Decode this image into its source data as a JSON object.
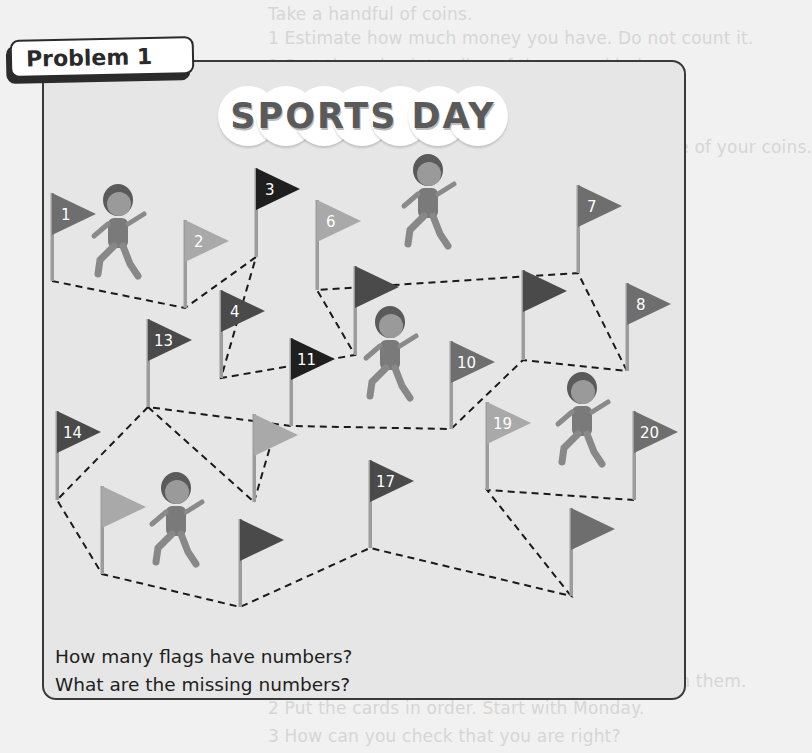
{
  "background_text": [
    {
      "text": "Take a handful of coins.",
      "x": 268,
      "y": 18
    },
    {
      "text": "1 Estimate how much money you have. Do not count it.",
      "x": 268,
      "y": 42
    },
    {
      "text": "2 Sort the coins into piles of the same kind.",
      "x": 268,
      "y": 70
    },
    {
      "text": "a  What kind of coin do you have the most of?",
      "x": 285,
      "y": 97
    },
    {
      "text": "b  Which kind do you have the fewest of?",
      "x": 285,
      "y": 124
    },
    {
      "text": "3 Use a number line to help you count the value of your coins.",
      "x": 268,
      "y": 151
    },
    {
      "text": "Was your estimate close?",
      "x": 285,
      "y": 177
    },
    {
      "text": "B Measure",
      "x": 268,
      "y": 233
    },
    {
      "text": "1 Look at the objects on the table.",
      "x": 268,
      "y": 260
    },
    {
      "text": "a  How many cubes long is each object?",
      "x": 285,
      "y": 288
    },
    {
      "text": "b  Estimate the length of each.",
      "x": 285,
      "y": 315
    },
    {
      "text": "2 Which is the longest? Which is the shortest?",
      "x": 268,
      "y": 380
    },
    {
      "text": "3 Put the objects in order of length.",
      "x": 268,
      "y": 408
    },
    {
      "text": "Write which one is the longest.",
      "x": 285,
      "y": 462
    },
    {
      "text": "4 Which container holds the most?",
      "x": 268,
      "y": 516
    },
    {
      "text": "Fill each container with water.",
      "x": 285,
      "y": 544
    },
    {
      "text": "Which holds the least?",
      "x": 285,
      "y": 572
    },
    {
      "text": "C Time",
      "x": 268,
      "y": 657
    },
    {
      "text": "1 Shuffle the cards with the days of the week on them.",
      "x": 268,
      "y": 685
    },
    {
      "text": "2 Put the cards in order. Start with Monday.",
      "x": 268,
      "y": 712
    },
    {
      "text": "3 How can you check that you are right?",
      "x": 268,
      "y": 740
    }
  ],
  "problem": {
    "label": "Problem 1",
    "banner_title": "SPORTS DAY",
    "questions": [
      "How many flags have numbers?",
      "What are the missing numbers?"
    ]
  },
  "colors": {
    "panel_bg": "#e6e6e6",
    "panel_border": "#3a3a3a",
    "flag_black": "#1f1f1f",
    "flag_dark": "#4a4a4a",
    "flag_medium": "#6e6e6e",
    "flag_light": "#a9a9a9"
  },
  "flags": [
    {
      "id": "flag-1",
      "label": "1",
      "x": 52,
      "top": 193,
      "bottom": 281,
      "shade": "medium"
    },
    {
      "id": "flag-2",
      "label": "2",
      "x": 185,
      "top": 220,
      "bottom": 308,
      "shade": "light"
    },
    {
      "id": "flag-3",
      "label": "3",
      "x": 256,
      "top": 168,
      "bottom": 257,
      "shade": "black"
    },
    {
      "id": "flag-4",
      "label": "4",
      "x": 221,
      "top": 290,
      "bottom": 378,
      "shade": "dark"
    },
    {
      "id": "flag-blank-a",
      "label": "",
      "x": 355,
      "top": 266,
      "bottom": 355,
      "shade": "dark"
    },
    {
      "id": "flag-6",
      "label": "6",
      "x": 317,
      "top": 200,
      "bottom": 290,
      "shade": "light"
    },
    {
      "id": "flag-7",
      "label": "7",
      "x": 578,
      "top": 185,
      "bottom": 273,
      "shade": "medium"
    },
    {
      "id": "flag-8",
      "label": "8",
      "x": 627,
      "top": 283,
      "bottom": 371,
      "shade": "medium"
    },
    {
      "id": "flag-blank-b",
      "label": "",
      "x": 523,
      "top": 270,
      "bottom": 360,
      "shade": "dark"
    },
    {
      "id": "flag-10",
      "label": "10",
      "x": 451,
      "top": 341,
      "bottom": 429,
      "shade": "medium"
    },
    {
      "id": "flag-11",
      "label": "11",
      "x": 291,
      "top": 338,
      "bottom": 426,
      "shade": "black"
    },
    {
      "id": "flag-13",
      "label": "13",
      "x": 148,
      "top": 319,
      "bottom": 407,
      "shade": "dark"
    },
    {
      "id": "flag-14",
      "label": "14",
      "x": 57,
      "top": 411,
      "bottom": 500,
      "shade": "dark"
    },
    {
      "id": "flag-blank-c",
      "label": "",
      "x": 254,
      "top": 414,
      "bottom": 502,
      "shade": "light"
    },
    {
      "id": "flag-blank-d",
      "label": "",
      "x": 102,
      "top": 486,
      "bottom": 574,
      "shade": "light"
    },
    {
      "id": "flag-blank-e",
      "label": "",
      "x": 240,
      "top": 519,
      "bottom": 607,
      "shade": "dark"
    },
    {
      "id": "flag-17",
      "label": "17",
      "x": 370,
      "top": 460,
      "bottom": 548,
      "shade": "dark"
    },
    {
      "id": "flag-blank-f",
      "label": "",
      "x": 571,
      "top": 508,
      "bottom": 596,
      "shade": "medium"
    },
    {
      "id": "flag-19",
      "label": "19",
      "x": 487,
      "top": 402,
      "bottom": 490,
      "shade": "light"
    },
    {
      "id": "flag-20",
      "label": "20",
      "x": 634,
      "top": 411,
      "bottom": 500,
      "shade": "medium"
    }
  ],
  "path_points": [
    [
      52,
      281
    ],
    [
      185,
      308
    ],
    [
      256,
      257
    ],
    [
      221,
      378
    ],
    [
      355,
      355
    ],
    [
      317,
      290
    ],
    [
      578,
      273
    ],
    [
      627,
      371
    ],
    [
      523,
      360
    ],
    [
      451,
      429
    ],
    [
      291,
      426
    ],
    [
      148,
      407
    ],
    [
      57,
      500
    ],
    [
      102,
      574
    ],
    [
      240,
      607
    ],
    [
      370,
      548
    ],
    [
      571,
      596
    ],
    [
      487,
      490
    ],
    [
      634,
      500
    ]
  ],
  "extra_segments": [
    [
      [
        148,
        407
      ],
      [
        254,
        502
      ]
    ],
    [
      [
        254,
        502
      ],
      [
        275,
        430
      ]
    ]
  ],
  "runners": [
    {
      "id": "runner-girl-ponytail",
      "x": 118,
      "y": 200
    },
    {
      "id": "runner-boy-curly",
      "x": 428,
      "y": 170
    },
    {
      "id": "runner-boy-arms-up",
      "x": 390,
      "y": 322
    },
    {
      "id": "runner-boy-afro",
      "x": 582,
      "y": 388
    },
    {
      "id": "runner-girl-braids",
      "x": 176,
      "y": 488
    }
  ]
}
